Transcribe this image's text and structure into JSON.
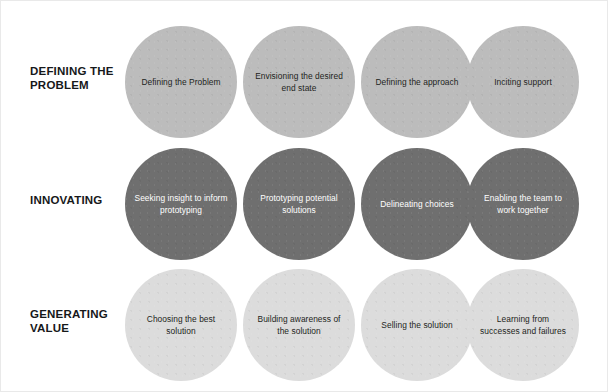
{
  "diagram": {
    "title_rows": 3,
    "columns": 4,
    "background_color": "#ffffff",
    "rows": [
      {
        "label": "Defining the\nProblem",
        "label_display": "DEFINING THE\nPROBLEM",
        "circle_color": "#bcbcbc",
        "text_color": "#1d1f21",
        "circles": [
          {
            "label": "Defining the Problem"
          },
          {
            "label": "Envisioning the desired end state"
          },
          {
            "label": "Defining the approach"
          },
          {
            "label": "Inciting support"
          }
        ]
      },
      {
        "label": "Innovating",
        "label_display": "INNOVATING",
        "circle_color": "#6f6f6f",
        "text_color": "#ffffff",
        "circles": [
          {
            "label": "Seeking insight to inform prototyping"
          },
          {
            "label": "Prototyping potential solutions"
          },
          {
            "label": "Delineating choices"
          },
          {
            "label": "Enabling the team to work together"
          }
        ]
      },
      {
        "label": "Generating Value",
        "label_display": "GENERATING\nVALUE",
        "circle_color": "#dcdcdc",
        "text_color": "#1d1f21",
        "circles": [
          {
            "label": "Choosing the best solution"
          },
          {
            "label": "Building awareness of the solution"
          },
          {
            "label": "Selling the solution"
          },
          {
            "label": "Learning from successes and failures"
          }
        ]
      }
    ]
  }
}
